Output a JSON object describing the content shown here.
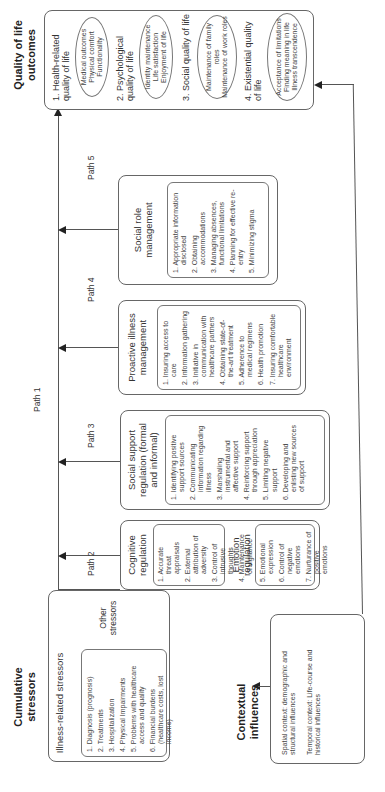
{
  "cumulative_stressors": {
    "title": "Cumulative stressors",
    "illness_related": {
      "header": "Illness-related stressors",
      "items": [
        "1. Diagnosis (prognosis)",
        "2. Treatments",
        "3. Hospitalization",
        "4. Physical Impairments",
        "5. Problems with healthcare access and quality",
        "6. Financial burdens (healthcare costs, lost income)"
      ]
    },
    "other": "Other stressors"
  },
  "contextual_influences": {
    "title": "Contextual influences",
    "spatial": "Spatial context: demographic and structural influences",
    "temporal": "Temporal context: Life-course and historical influences"
  },
  "regulation": {
    "cognitive": {
      "header": "Cognitive regulation",
      "items": [
        "1. Accurate threat appraisals",
        "2. External attribution of adversity",
        "3. Control of intrusive thoughts",
        "4. Maintenance of vigilance"
      ]
    },
    "emotion": {
      "header": "Emotion regulation",
      "items": [
        "5. Emotional expression",
        "6. Control of negative emotions",
        "7. Nurturance of positive emotions"
      ]
    }
  },
  "social_support": {
    "header": "Social support regulation (formal and informal)",
    "items": [
      "1. Identifying positive support sources",
      "2. Communicating information regarding illness",
      "3. Marshaling instrumental and affective support",
      "4. Reinforcing support through appreciation",
      "5. Limiting negative support",
      "6. Developing and enlisting new sources of support"
    ]
  },
  "proactive": {
    "header": "Proactive illness management",
    "items": [
      "1. Insuring access to care",
      "2. Information gathering",
      "3. Initiative in communication with healthcare partners",
      "4. Obtaining state-of-the-art treatment",
      "5. Adherence to medical regimens",
      "6. Health promotion",
      "7. Insuring comfortable healthcare environment"
    ]
  },
  "social_role": {
    "header": "Social role management",
    "items": [
      "1. Appropriate information disclosed",
      "2. Obtaining accommodations",
      "3. Managing absences, functional limitations",
      "4. Planning for effective re-entry",
      "5. Minimizing stigma"
    ]
  },
  "paths": {
    "p1": "Path 1",
    "p2": "Path 2",
    "p3": "Path 3",
    "p4": "Path 4",
    "p5": "Path 5"
  },
  "quality_of_life": {
    "title": "Quality of life outcomes",
    "items": [
      {
        "label": "1. Health-related quality of life",
        "oval": [
          "Medical outcomes",
          "Physical comfort",
          "Functionality"
        ]
      },
      {
        "label": "2. Psychological quality of life",
        "oval": [
          "Identity maintenance",
          "Life satisfaction",
          "Enjoyment of life"
        ]
      },
      {
        "label": "3. Social quality of life",
        "oval": [
          "Maintenance of family roles",
          "Maintenance of work roles"
        ]
      },
      {
        "label": "4. Existential quality of life",
        "oval": [
          "Acceptance of limitations",
          "Finding meaning in life",
          "Illness transcendence"
        ]
      }
    ]
  }
}
